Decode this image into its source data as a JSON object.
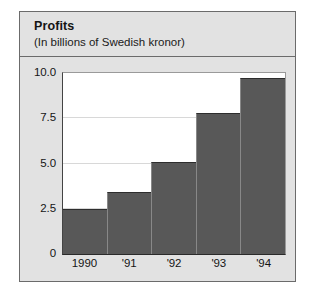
{
  "figure": {
    "title": "Profits",
    "subtitle": "(In billions of Swedish kronor)"
  },
  "colors": {
    "bar_fill": "#585858",
    "panel_background": "#e2e2e2",
    "plot_background": "#ffffff",
    "gridline": "#d8d8d8",
    "frame_border": "#6b6b6b"
  },
  "chart_data": {
    "type": "bar",
    "title": "Profits",
    "subtitle": "(In billions of Swedish kronor)",
    "xlabel": "",
    "ylabel": "",
    "categories": [
      "1990",
      "'91",
      "'92",
      "'93",
      "'94"
    ],
    "values": [
      2.5,
      3.4,
      5.1,
      7.8,
      9.7
    ],
    "ylim": [
      0,
      10.0
    ],
    "yticks": [
      0,
      2.5,
      5.0,
      7.5,
      10.0
    ],
    "ytick_labels": [
      "0",
      "2.5",
      "5.0",
      "7.5",
      "10.0"
    ],
    "grid": true,
    "legend": null,
    "series": [
      {
        "name": "Profits",
        "values": [
          2.5,
          3.4,
          5.1,
          7.8,
          9.7
        ]
      }
    ]
  }
}
